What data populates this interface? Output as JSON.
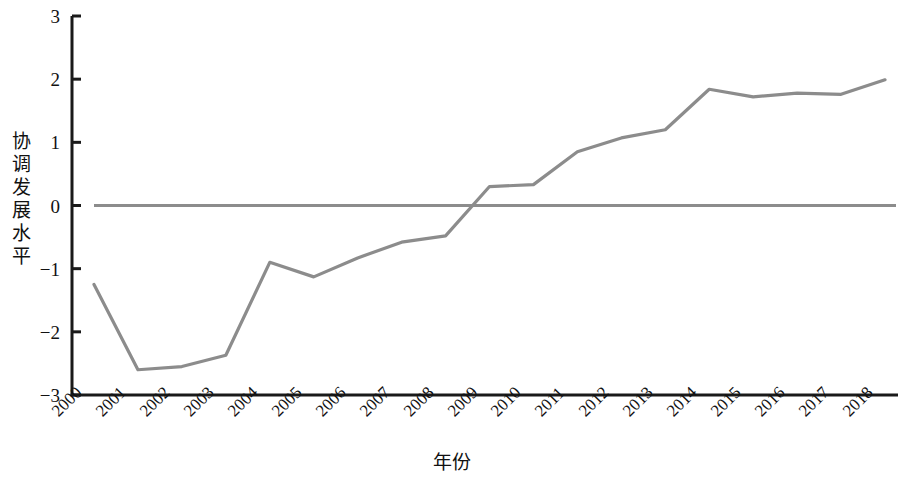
{
  "chart_data": {
    "type": "line",
    "title": "",
    "subtitle": "",
    "xlabel": "年份",
    "ylabel": "协调发展水平",
    "ylabel_chars": [
      "协",
      "调",
      "发",
      "展",
      "水",
      "平"
    ],
    "categories": [
      "2000",
      "2001",
      "2002",
      "2003",
      "2004",
      "2005",
      "2006",
      "2007",
      "2008",
      "2009",
      "2010",
      "2011",
      "2012",
      "2013",
      "2014",
      "2015",
      "2016",
      "2017",
      "2018"
    ],
    "x": [
      2000,
      2001,
      2002,
      2003,
      2004,
      2005,
      2006,
      2007,
      2008,
      2009,
      2010,
      2011,
      2012,
      2013,
      2014,
      2015,
      2016,
      2017,
      2018
    ],
    "values": [
      -1.25,
      -2.6,
      -2.55,
      -2.37,
      -0.9,
      -1.13,
      -0.83,
      -0.58,
      -0.48,
      0.3,
      0.33,
      0.85,
      1.07,
      1.2,
      1.84,
      1.72,
      1.78,
      1.76,
      1.99
    ],
    "series": [
      {
        "name": "协调发展水平",
        "values": [
          -1.25,
          -2.6,
          -2.55,
          -2.37,
          -0.9,
          -1.13,
          -0.83,
          -0.58,
          -0.48,
          0.3,
          0.33,
          0.85,
          1.07,
          1.2,
          1.84,
          1.72,
          1.78,
          1.76,
          1.99
        ],
        "color": "#8c8c8c"
      }
    ],
    "reference_lines": [
      {
        "name": "zero-line",
        "value": 0,
        "color": "#8c8c8c"
      }
    ],
    "ylim": [
      -3,
      3
    ],
    "yticks": [
      3,
      2,
      1,
      0,
      -1,
      -2,
      -3
    ],
    "ytick_labels": [
      "3",
      "2",
      "1",
      "0",
      "−1",
      "−2",
      "−3"
    ],
    "grid": false,
    "legend": "none",
    "axis_color": "#1a1a1a",
    "line_color": "#8c8c8c",
    "background": "#ffffff"
  }
}
